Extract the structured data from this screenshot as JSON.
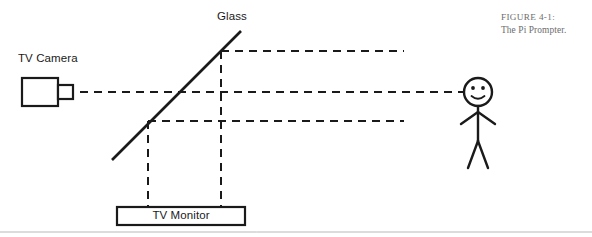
{
  "figure": {
    "number_label": "FIGURE 4-1:",
    "title": "The Pi Prompter."
  },
  "diagram": {
    "type": "optical-ray-diagram",
    "background_color": "#ffffff",
    "stroke_color": "#1a1a1a",
    "caption_color": "#6d6d6d",
    "labels": {
      "glass": "Glass",
      "tv_camera": "TV Camera",
      "tv_monitor": "TV Monitor"
    },
    "components": [
      {
        "name": "tv-camera",
        "label": "TV Camera",
        "shape": "box-with-lens",
        "body": {
          "x": 22,
          "y": 78,
          "width": 36,
          "height": 28
        },
        "lens": {
          "x": 58,
          "y": 85,
          "width": 15,
          "height": 14
        }
      },
      {
        "name": "beam-splitter-glass",
        "label": "Glass",
        "shape": "diagonal-line",
        "from": {
          "x": 112,
          "y": 160
        },
        "to": {
          "x": 241,
          "y": 31
        }
      },
      {
        "name": "tv-monitor",
        "label": "TV Monitor",
        "shape": "rectangle",
        "box": {
          "x": 117,
          "y": 207,
          "width": 128,
          "height": 18
        }
      },
      {
        "name": "viewer-stick-figure",
        "shape": "stick-figure-smiley",
        "head": {
          "cx": 478,
          "cy": 92,
          "r": 14
        }
      }
    ],
    "ray_paths": [
      {
        "name": "upper-reflected-ray",
        "orientation": "horizontal",
        "y": 51,
        "x_start": 221,
        "x_end": 404,
        "style": "dashed"
      },
      {
        "name": "camera-sight-ray",
        "orientation": "horizontal",
        "y": 92,
        "x_start": 80,
        "x_end": 463,
        "style": "dashed"
      },
      {
        "name": "lower-reflected-ray",
        "orientation": "horizontal",
        "y": 121,
        "x_start": 148,
        "x_end": 404,
        "style": "dashed"
      },
      {
        "name": "monitor-up-ray-left",
        "orientation": "vertical",
        "x": 148,
        "y_start": 121,
        "y_end": 207,
        "style": "dashed"
      },
      {
        "name": "monitor-up-ray-right",
        "orientation": "vertical",
        "x": 221,
        "y_start": 51,
        "y_end": 207,
        "style": "dashed"
      }
    ],
    "footer_rule": {
      "y": 232,
      "x_start": 0,
      "x_end": 592
    }
  }
}
